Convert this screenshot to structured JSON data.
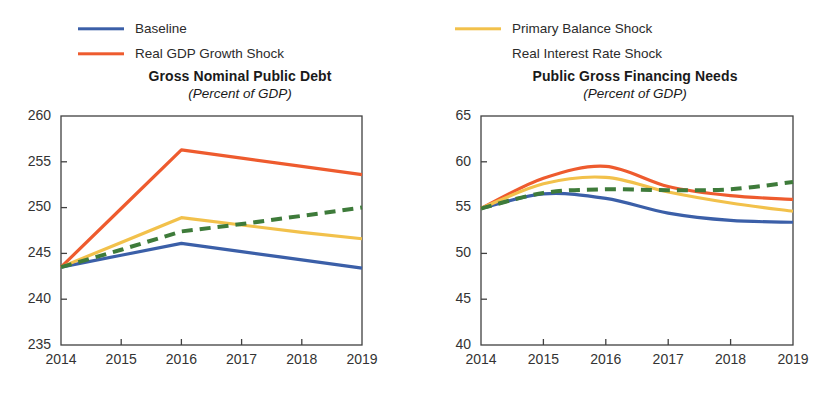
{
  "legend": {
    "left_column": [
      {
        "label": "Baseline",
        "color": "#3B5FA8",
        "style": "solid",
        "icon": "line-swatch-icon"
      },
      {
        "label": "Real GDP Growth Shock",
        "color": "#EE5B2E",
        "style": "solid",
        "icon": "line-swatch-icon"
      }
    ],
    "right_column": [
      {
        "label": "Primary Balance Shock",
        "color": "#F2C14B",
        "style": "solid",
        "icon": "line-swatch-icon"
      },
      {
        "label": "Real Interest Rate Shock",
        "color": "#3E7B3A",
        "style": "dashed",
        "icon": "dashed-line-swatch-icon"
      }
    ]
  },
  "chart_data": [
    {
      "type": "line",
      "title": "Gross Nominal Public Debt",
      "subtitle": "(Percent of GDP)",
      "xlabel": "",
      "ylabel": "",
      "x": [
        2014,
        2015,
        2016,
        2017,
        2018,
        2019
      ],
      "xtick_labels": [
        "2014",
        "2015",
        "2016",
        "2017",
        "2018",
        "2019"
      ],
      "xlim": [
        2014,
        2019
      ],
      "ytick_labels": [
        "235",
        "240",
        "245",
        "250",
        "255",
        "260"
      ],
      "yticks": [
        235,
        240,
        245,
        250,
        255,
        260
      ],
      "ylim": [
        235,
        260
      ],
      "grid": false,
      "legend_position": "above",
      "series": [
        {
          "name": "Baseline",
          "color": "#3B5FA8",
          "style": "solid",
          "values": [
            243.5,
            244.8,
            246.1,
            245.2,
            244.3,
            243.4
          ]
        },
        {
          "name": "Real GDP Growth Shock",
          "color": "#EE5B2E",
          "style": "solid",
          "values": [
            243.5,
            249.9,
            256.3,
            255.4,
            254.5,
            253.6
          ]
        },
        {
          "name": "Primary Balance Shock",
          "color": "#F2C14B",
          "style": "solid",
          "values": [
            243.5,
            246.2,
            248.9,
            248.1,
            247.3,
            246.6
          ]
        },
        {
          "name": "Real Interest Rate Shock",
          "color": "#3E7B3A",
          "style": "dashed",
          "values": [
            243.5,
            245.4,
            247.4,
            248.2,
            249.1,
            250.0
          ]
        }
      ]
    },
    {
      "type": "line",
      "title": "Public Gross Financing Needs",
      "subtitle": "(Percent of GDP)",
      "xlabel": "",
      "ylabel": "",
      "x": [
        2014,
        2015,
        2016,
        2017,
        2018,
        2019
      ],
      "xtick_labels": [
        "2014",
        "2015",
        "2016",
        "2017",
        "2018",
        "2019"
      ],
      "xlim": [
        2014,
        2019
      ],
      "ytick_labels": [
        "40",
        "45",
        "50",
        "55",
        "60",
        "65"
      ],
      "yticks": [
        40,
        45,
        50,
        55,
        60,
        65
      ],
      "ylim": [
        40,
        65
      ],
      "grid": false,
      "legend_position": "above",
      "series": [
        {
          "name": "Baseline",
          "color": "#3B5FA8",
          "style": "solid",
          "values": [
            54.9,
            56.5,
            56.0,
            54.4,
            53.6,
            53.4
          ]
        },
        {
          "name": "Real GDP Growth Shock",
          "color": "#EE5B2E",
          "style": "solid",
          "values": [
            54.9,
            58.2,
            59.5,
            57.3,
            56.3,
            55.9
          ]
        },
        {
          "name": "Primary Balance Shock",
          "color": "#F2C14B",
          "style": "solid",
          "values": [
            54.9,
            57.6,
            58.3,
            56.7,
            55.5,
            54.6
          ]
        },
        {
          "name": "Real Interest Rate Shock",
          "color": "#3E7B3A",
          "style": "dashed",
          "values": [
            54.9,
            56.6,
            57.0,
            56.9,
            57.0,
            57.8
          ]
        }
      ]
    }
  ]
}
